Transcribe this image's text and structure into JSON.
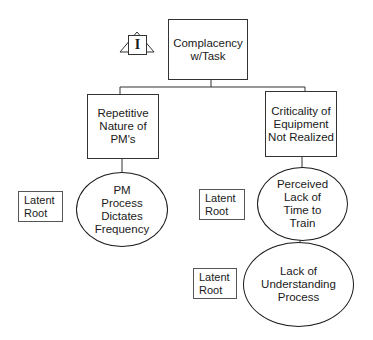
{
  "diagram": {
    "type": "root-cause-tree",
    "colors": {
      "line": "#333333",
      "background": "#ffffff",
      "text": "#1a1a1a"
    },
    "root_marker": {
      "icon": "triangle-i-icon",
      "letter": "I"
    },
    "nodes": {
      "root": "Complacency\nw/Task",
      "left_cause": "Repetitive\nNature of\nPM's",
      "right_cause": "Criticality of\nEquipment\nNot Realized",
      "left_root": "PM\nProcess\nDictates\nFrequency",
      "right_root_1": "Perceived\nLack of\nTime to\nTrain",
      "right_root_2": "Lack of\nUnderstanding\nProcess"
    },
    "labels": {
      "latent_left": "Latent\nRoot",
      "latent_right_1": "Latent\nRoot",
      "latent_right_2": "Latent\nRoot"
    }
  }
}
